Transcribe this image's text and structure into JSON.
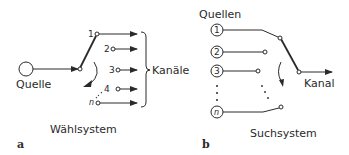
{
  "panel_a": {
    "letter": "a",
    "source_label": "Quelle",
    "channels_label": "Kanäle",
    "system_label": "Wählsystem",
    "contacts": [
      "1",
      "2",
      "3",
      "4",
      "n"
    ]
  },
  "panel_b": {
    "letter": "b",
    "sources_label": "Quellen",
    "channel_label": "Kanal",
    "system_label": "Suchsystem",
    "sources": [
      "1",
      "2",
      "3",
      "n"
    ]
  },
  "colors": {
    "ink": "#2a2a2a",
    "background": "#ffffff"
  }
}
